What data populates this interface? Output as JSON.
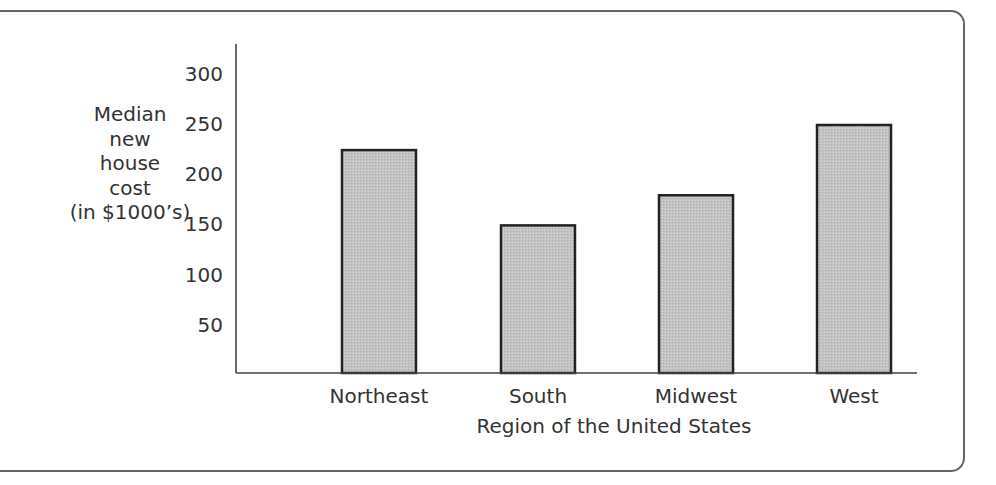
{
  "chart_data": {
    "type": "bar",
    "title": "",
    "xlabel": "Region of the United States",
    "ylabel": "Median new house cost (in $1000's)",
    "ylabel_lines": [
      "Median",
      "new",
      "house",
      "cost",
      "(in $1000’s)"
    ],
    "categories": [
      "Northeast",
      "South",
      "Midwest",
      "West"
    ],
    "values": [
      225,
      150,
      180,
      250
    ],
    "yticks": [
      50,
      100,
      150,
      200,
      250,
      300
    ],
    "ylim": [
      0,
      330
    ],
    "grid": false,
    "legend": null,
    "bar_fill": "#bdbdbd",
    "bar_stroke": "#222222"
  }
}
